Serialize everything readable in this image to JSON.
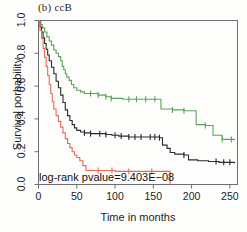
{
  "figure": {
    "panel_title": "(b) ccB",
    "annotation": "log-rank pvalue=9.403E−08",
    "width": 247,
    "height": 232
  },
  "axes": {
    "x_title": "Time in months",
    "y_title": "Survival porbability",
    "x_ticks": [
      "0",
      "50",
      "100",
      "150",
      "200",
      "250"
    ],
    "y_ticks": [
      "0.0",
      "0.2",
      "0.4",
      "0.6",
      "0.8",
      "1.0"
    ]
  },
  "chart_data": {
    "type": "line",
    "subtype": "kaplan-meier-step",
    "title": "(b) ccB",
    "xlabel": "Time in months",
    "ylabel": "Survival porbability",
    "xlim": [
      0,
      260
    ],
    "ylim": [
      0.0,
      1.0
    ],
    "xticks": [
      0,
      50,
      100,
      150,
      200,
      250
    ],
    "yticks": [
      0.0,
      0.2,
      0.4,
      0.6,
      0.8,
      1.0
    ],
    "grid": false,
    "legend": "none",
    "annotations": [
      {
        "text": "log-rank pvalue=9.403E−08",
        "x": 2,
        "y": 0.04
      }
    ],
    "series": [
      {
        "name": "group-green",
        "color": "#5aa45a",
        "points": [
          [
            0,
            1.0
          ],
          [
            3,
            0.975
          ],
          [
            5,
            0.955
          ],
          [
            8,
            0.93
          ],
          [
            11,
            0.9
          ],
          [
            14,
            0.875
          ],
          [
            17,
            0.85
          ],
          [
            20,
            0.82
          ],
          [
            23,
            0.8
          ],
          [
            26,
            0.78
          ],
          [
            29,
            0.755
          ],
          [
            31,
            0.72
          ],
          [
            33,
            0.7
          ],
          [
            35,
            0.675
          ],
          [
            37,
            0.655
          ],
          [
            40,
            0.635
          ],
          [
            43,
            0.61
          ],
          [
            46,
            0.59
          ],
          [
            50,
            0.575
          ],
          [
            55,
            0.565
          ],
          [
            60,
            0.555
          ],
          [
            68,
            0.555
          ],
          [
            78,
            0.545
          ],
          [
            88,
            0.535
          ],
          [
            95,
            0.525
          ],
          [
            110,
            0.52
          ],
          [
            125,
            0.52
          ],
          [
            140,
            0.52
          ],
          [
            152,
            0.52
          ],
          [
            158,
            0.52
          ],
          [
            160,
            0.46
          ],
          [
            175,
            0.455
          ],
          [
            190,
            0.45
          ],
          [
            203,
            0.45
          ],
          [
            206,
            0.365
          ],
          [
            218,
            0.36
          ],
          [
            228,
            0.3
          ],
          [
            240,
            0.275
          ],
          [
            256,
            0.27
          ]
        ],
        "censored": [
          68,
          78,
          88,
          95,
          118,
          128,
          140,
          152,
          175,
          190,
          218,
          240,
          252
        ]
      },
      {
        "name": "group-black",
        "color": "#2b2b2b",
        "points": [
          [
            0,
            1.0
          ],
          [
            2,
            0.96
          ],
          [
            4,
            0.93
          ],
          [
            6,
            0.895
          ],
          [
            8,
            0.86
          ],
          [
            10,
            0.825
          ],
          [
            12,
            0.79
          ],
          [
            14,
            0.755
          ],
          [
            17,
            0.715
          ],
          [
            20,
            0.675
          ],
          [
            23,
            0.63
          ],
          [
            26,
            0.59
          ],
          [
            29,
            0.545
          ],
          [
            32,
            0.5
          ],
          [
            35,
            0.455
          ],
          [
            38,
            0.42
          ],
          [
            41,
            0.39
          ],
          [
            44,
            0.365
          ],
          [
            47,
            0.345
          ],
          [
            50,
            0.33
          ],
          [
            55,
            0.32
          ],
          [
            60,
            0.315
          ],
          [
            68,
            0.31
          ],
          [
            78,
            0.31
          ],
          [
            88,
            0.305
          ],
          [
            96,
            0.3
          ],
          [
            105,
            0.295
          ],
          [
            118,
            0.29
          ],
          [
            130,
            0.29
          ],
          [
            145,
            0.29
          ],
          [
            158,
            0.285
          ],
          [
            162,
            0.24
          ],
          [
            168,
            0.22
          ],
          [
            172,
            0.195
          ],
          [
            178,
            0.185
          ],
          [
            190,
            0.18
          ],
          [
            196,
            0.15
          ],
          [
            208,
            0.145
          ],
          [
            222,
            0.14
          ],
          [
            236,
            0.135
          ],
          [
            256,
            0.13
          ]
        ],
        "censored": [
          60,
          68,
          80,
          88,
          100,
          108,
          118,
          126,
          134,
          146,
          152,
          158,
          190,
          232,
          242,
          250
        ]
      },
      {
        "name": "group-red",
        "color": "#e8695a",
        "points": [
          [
            0,
            1.0
          ],
          [
            2,
            0.94
          ],
          [
            4,
            0.89
          ],
          [
            6,
            0.83
          ],
          [
            8,
            0.775
          ],
          [
            10,
            0.72
          ],
          [
            12,
            0.665
          ],
          [
            14,
            0.61
          ],
          [
            16,
            0.555
          ],
          [
            18,
            0.505
          ],
          [
            20,
            0.46
          ],
          [
            23,
            0.42
          ],
          [
            26,
            0.385
          ],
          [
            29,
            0.35
          ],
          [
            32,
            0.315
          ],
          [
            35,
            0.28
          ],
          [
            38,
            0.25
          ],
          [
            41,
            0.225
          ],
          [
            44,
            0.2
          ],
          [
            47,
            0.18
          ],
          [
            50,
            0.165
          ],
          [
            54,
            0.145
          ],
          [
            58,
            0.115
          ],
          [
            62,
            0.085
          ],
          [
            80,
            0.085
          ],
          [
            100,
            0.08
          ],
          [
            120,
            0.08
          ],
          [
            145,
            0.08
          ],
          [
            168,
            0.08
          ],
          [
            172,
            0.08
          ],
          [
            172,
            0.0
          ]
        ],
        "censored": [
          78,
          96,
          118,
          148
        ]
      }
    ]
  }
}
